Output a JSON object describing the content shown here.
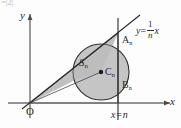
{
  "figure": {
    "kind": "coordinate-geometry-diagram",
    "top_cut_text": "=|2|.",
    "axes": {
      "y_label": "y",
      "x_label": "x",
      "origin_label": "O"
    },
    "points": {
      "A": {
        "base": "A",
        "subscript": "n"
      },
      "B": {
        "base": "B",
        "subscript": "n"
      },
      "C": {
        "base": "C",
        "subscript": "n"
      }
    },
    "region": {
      "base": "S",
      "subscript": "n"
    },
    "line_equation": {
      "lhs": "y",
      "equals": "=",
      "numerator": "1",
      "denominator": "n",
      "variable": "x",
      "plain": "y = (1/n)x"
    },
    "vertical_line_equation": {
      "lhs": "x",
      "equals": "=",
      "rhs": "n",
      "plain": "x = n"
    },
    "colors": {
      "stroke": "#2b2b2b",
      "axis": "#4a4a4a",
      "shade_fill": "#c9c9c9",
      "circle_fill": "#bdbdbd",
      "background": "#fdfdfd",
      "point_dot": "#1a1a1a"
    },
    "geometry": {
      "origin_px": {
        "x": 30,
        "y": 103
      },
      "A_px": {
        "x": 118,
        "y": 33
      },
      "B_px": {
        "x": 118,
        "y": 103
      },
      "C_px": {
        "x": 101,
        "y": 72
      },
      "circle_radius_px": 28,
      "vertical_line_x_px": 118,
      "x_axis_y_px": 103,
      "y_axis_x_px": 30
    }
  }
}
